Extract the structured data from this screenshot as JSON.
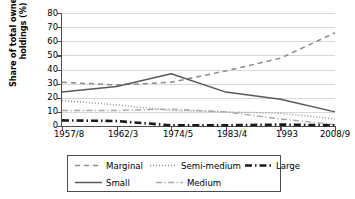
{
  "chart_data": {
    "type": "line",
    "title": "",
    "xlabel": "",
    "ylabel": "Share of total ownership holdings (%)",
    "categories": [
      "1957/8",
      "1962/3",
      "1974/5",
      "1983/4",
      "1993",
      "2008/9"
    ],
    "ylim": [
      0,
      80
    ],
    "ytick_step": 10,
    "yticks": [
      "0",
      "10",
      "20",
      "30",
      "40",
      "50",
      "60",
      "70",
      "80"
    ],
    "grid": "horizontal",
    "legend_position": "below-plot",
    "series": [
      {
        "name": "Marginal",
        "style": "dashed",
        "color": "#8c8c8c",
        "width": 1.5,
        "values": [
          31,
          29,
          31,
          39,
          48,
          66
        ]
      },
      {
        "name": "Small",
        "style": "solid",
        "color": "#595959",
        "width": 1.5,
        "values": [
          24,
          28,
          37,
          24,
          19,
          10
        ]
      },
      {
        "name": "Semi-medium",
        "style": "dotted",
        "color": "#8c8c8c",
        "width": 1.4,
        "values": [
          18,
          15,
          11,
          10,
          9,
          5
        ]
      },
      {
        "name": "Medium",
        "style": "dash-dot-thin",
        "color": "#a6a6a6",
        "width": 1.4,
        "values": [
          11,
          11,
          12,
          10,
          5,
          1
        ]
      },
      {
        "name": "Large",
        "style": "dash-dot-bold",
        "color": "#1a1a1a",
        "width": 2.6,
        "values": [
          4,
          3.5,
          0.5,
          0.5,
          1,
          0.5
        ]
      }
    ]
  },
  "legend": {
    "rows": [
      [
        {
          "label": "Marginal",
          "series": "Marginal"
        },
        {
          "label": "Semi-medium",
          "series": "Semi-medium"
        },
        {
          "label": "Large",
          "series": "Large"
        }
      ],
      [
        {
          "label": "Small",
          "series": "Small"
        },
        {
          "label": "Medium",
          "series": "Medium"
        }
      ]
    ]
  },
  "colors": {
    "axis": "#4d4d4d",
    "grid": "#d8d8d8",
    "background": "#ffffff",
    "text": "#000000"
  }
}
